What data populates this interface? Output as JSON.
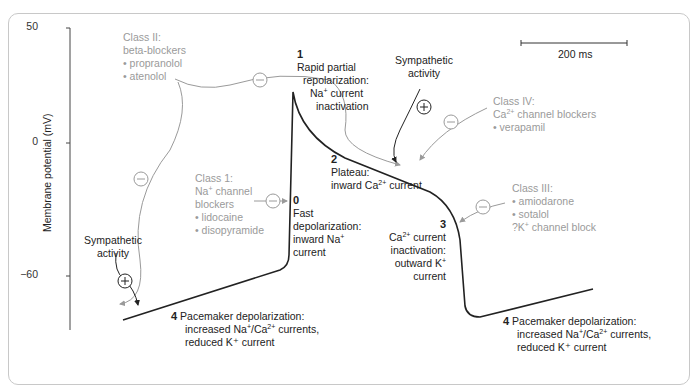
{
  "figure": {
    "y_axis": {
      "label": "Membrane potential (mV)",
      "ticks": [
        "50",
        "0",
        "−60"
      ]
    },
    "scale_bar": {
      "label": "200 ms"
    },
    "phases": [
      {
        "number": "0",
        "lines": [
          "Fast",
          "depolarization:",
          "inward Na⁺",
          "current"
        ]
      },
      {
        "number": "1",
        "lines": [
          "Rapid partial",
          "repolarization:",
          "Na⁺ current",
          "inactivation"
        ]
      },
      {
        "number": "2",
        "lines": [
          "Plateau:",
          "inward Ca²⁺ current"
        ]
      },
      {
        "number": "3",
        "lines": [
          "Ca²⁺ current",
          "inactivation:",
          "outward K⁺",
          "current"
        ]
      },
      {
        "number": "4",
        "lines": [
          "Pacemaker depolarization:",
          "increased Na⁺/Ca²⁺ currents,",
          "reduced K⁺ current"
        ]
      }
    ],
    "drug_classes": [
      {
        "title": "Class 1:",
        "lines": [
          "Na⁺ channel",
          "blockers",
          "• lidocaine",
          "• disopyramide"
        ]
      },
      {
        "title": "Class II:",
        "lines": [
          "beta-blockers",
          "• propranolol",
          "• atenolol"
        ]
      },
      {
        "title": "Class III:",
        "lines": [
          "• amiodarone",
          "• sotalol",
          "?K⁺ channel block"
        ]
      },
      {
        "title": "Class IV:",
        "lines": [
          "Ca²⁺ channel blockers",
          "• verapamil"
        ]
      }
    ],
    "sympathetic": {
      "label_line1": "Sympathetic",
      "label_line2": "activity"
    },
    "symbols": {
      "minus": "−",
      "plus": "+"
    },
    "colors": {
      "trace": "#222222",
      "drug": "#9a9a9a",
      "frame": "#c8c8c8"
    }
  }
}
